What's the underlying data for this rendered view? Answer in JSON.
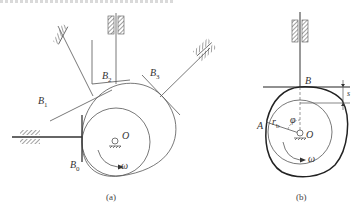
{
  "colors": {
    "line": "#444444",
    "thin": "#666666",
    "background": "#ffffff"
  },
  "figure_a": {
    "caption": "(a)",
    "labels": {
      "B0": {
        "base": "B",
        "sub": "0"
      },
      "B1": {
        "base": "B",
        "sub": "1"
      },
      "B2": {
        "base": "B",
        "sub": "2"
      },
      "B3": {
        "base": "B",
        "sub": "3"
      },
      "O": "O",
      "omega": "ω"
    }
  },
  "figure_b": {
    "caption": "(b)",
    "labels": {
      "B": "B",
      "A": "A",
      "rb": {
        "base": "r",
        "sub": "b"
      },
      "phi": "φ",
      "O": "O",
      "s": "s",
      "omega": "ω"
    }
  }
}
